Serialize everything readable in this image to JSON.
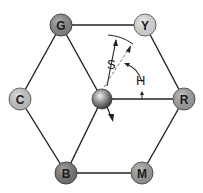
{
  "diagram": {
    "type": "HSV color hexcone (top view)",
    "nodes": [
      {
        "id": "G",
        "label": "G",
        "fill": "#8c8c8c"
      },
      {
        "id": "Y",
        "label": "Y",
        "fill": "#e6e6e6"
      },
      {
        "id": "C",
        "label": "C",
        "fill": "#cfcfcf"
      },
      {
        "id": "R",
        "label": "R",
        "fill": "#a6a6a6"
      },
      {
        "id": "B",
        "label": "B",
        "fill": "#7a7a7a"
      },
      {
        "id": "M",
        "label": "M",
        "fill": "#a0a0a0"
      }
    ],
    "center": {
      "label": "",
      "description": "white point sphere"
    },
    "annotations": {
      "saturation": "S",
      "hue": "H"
    }
  }
}
